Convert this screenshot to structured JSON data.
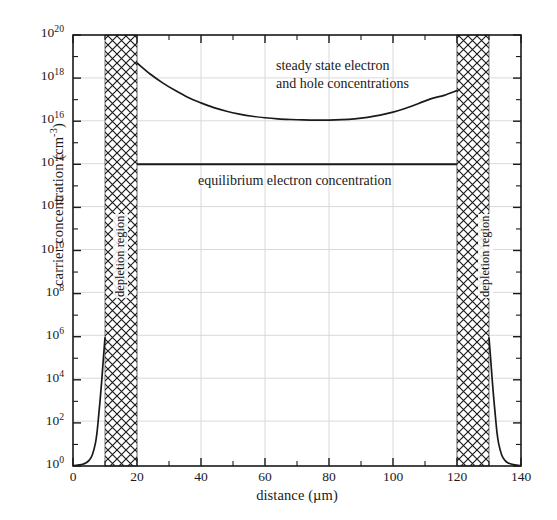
{
  "chart_data": {
    "type": "line",
    "title": "",
    "xlabel": "distance (µm)",
    "ylabel": "carrier concentration (cm",
    "ylabel_sup": "-3",
    "ylabel_suffix": ")",
    "xlim": [
      0,
      140
    ],
    "ylim_log10": [
      0,
      20
    ],
    "xticks": [
      0,
      20,
      40,
      60,
      80,
      100,
      120,
      140
    ],
    "xtick_labels": [
      "0",
      "20",
      "40",
      "60",
      "80",
      "100",
      "120",
      "140"
    ],
    "ytick_exponents": [
      0,
      2,
      4,
      6,
      8,
      10,
      12,
      14,
      16,
      18,
      20
    ],
    "ytick_labels": [
      "10",
      "10",
      "10",
      "10",
      "10",
      "10",
      "10",
      "10",
      "10",
      "10",
      "10"
    ],
    "ytick_sups": [
      "0",
      "2",
      "4",
      "6",
      "8",
      "10",
      "12",
      "14",
      "16",
      "18",
      "20"
    ],
    "yminor_exponents": [
      1,
      3,
      5,
      7,
      9,
      11,
      13,
      15,
      17,
      19
    ],
    "grid": true,
    "grid_color": "#d8d8d8",
    "axis_color": "#1a1a1a",
    "line_color": "#1a1a1a",
    "legend_position": "none",
    "series": [
      {
        "name": "steady state electron and hole concentrations",
        "comment": "log10 of concentration vs distance (um)",
        "x": [
          0,
          1,
          2,
          3,
          4,
          5,
          6,
          7,
          7.5,
          8,
          8.5,
          9,
          9.5,
          10,
          20,
          24,
          28,
          32,
          36,
          40,
          44,
          48,
          52,
          56,
          60,
          64,
          68,
          72,
          76,
          80,
          84,
          88,
          92,
          96,
          100,
          104,
          108,
          112,
          116,
          120,
          130,
          130.5,
          131,
          131.5,
          132,
          132.5,
          133,
          134,
          135,
          136,
          138,
          140
        ],
        "y_log10": [
          0.02,
          0.03,
          0.05,
          0.08,
          0.14,
          0.26,
          0.5,
          1.05,
          1.55,
          2.3,
          3.1,
          4.0,
          5.0,
          5.95,
          18.7,
          18.2,
          17.78,
          17.42,
          17.1,
          16.85,
          16.63,
          16.46,
          16.33,
          16.23,
          16.16,
          16.11,
          16.08,
          16.06,
          16.05,
          16.05,
          16.07,
          16.11,
          16.18,
          16.28,
          16.42,
          16.6,
          16.82,
          17.05,
          17.2,
          17.42,
          5.95,
          5.0,
          4.0,
          3.1,
          2.3,
          1.55,
          1.05,
          0.5,
          0.26,
          0.14,
          0.05,
          0.02
        ]
      },
      {
        "name": "equilibrium electron concentration",
        "comment": "flat line at 1e14 between the two depletion regions",
        "x": [
          20,
          120
        ],
        "y_log10": [
          14.0,
          14.0
        ]
      }
    ],
    "regions": [
      {
        "name": "depletion region",
        "label": "depletion region",
        "x_start": 10,
        "x_end": 20,
        "hatch": "crosshatch"
      },
      {
        "name": "depletion region",
        "label": "depletion region",
        "x_start": 120,
        "x_end": 130,
        "hatch": "crosshatch"
      }
    ],
    "annotations": [
      {
        "name": "steady-state-label",
        "text": "steady state electron\nand hole concentrations",
        "x": 59,
        "y_log10": 18.2
      },
      {
        "name": "equilibrium-label",
        "text": "equilibrium electron concentration",
        "x": 39,
        "y_log10": 13.1
      }
    ]
  }
}
